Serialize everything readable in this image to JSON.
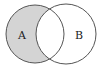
{
  "diagram": {
    "type": "venn",
    "title": "",
    "sets": [
      {
        "label": "A",
        "shaded_region": "only"
      },
      {
        "label": "B",
        "shaded_region": "none"
      }
    ],
    "shaded": "A minus B",
    "colors": {
      "fill": "#d4d4d4",
      "stroke": "#555555",
      "background": "#ffffff"
    }
  }
}
